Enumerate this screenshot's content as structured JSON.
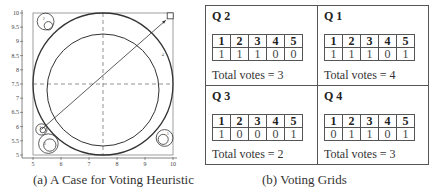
{
  "figure_a": {
    "caption": "(a) A Case for Voting Heuristic",
    "x_ticks": [
      "5",
      "6",
      "7",
      "8",
      "9",
      "10"
    ],
    "y_ticks": [
      "5",
      "5.5",
      "6",
      "6.5",
      "7",
      "7.5",
      "8",
      "8.5",
      "9",
      "9.5",
      "10"
    ],
    "xlim": [
      5,
      10
    ],
    "ylim": [
      5,
      10
    ],
    "big_circle": {
      "cx": 7.5,
      "cy": 7.5,
      "r": 2.5
    },
    "inner_circle": {
      "cx": 7.5,
      "cy": 7.5,
      "r": 2.0
    },
    "crosshair": {
      "x": 7.5,
      "y": 7.5
    },
    "arrow": {
      "from": [
        5.3,
        5.9
      ],
      "to": [
        9.85,
        9.85
      ]
    },
    "corner_square": {
      "x": 9.9,
      "y": 9.9
    },
    "center_label": "4",
    "center_label_pos": [
      9.6,
      8.5
    ],
    "small_circles": [
      {
        "name": "top-left",
        "outer": [
          5.45,
          9.7,
          0.3
        ],
        "inner": [
          5.55,
          9.55,
          0.15
        ],
        "label": "2",
        "label_pos": [
          5.35,
          9.75
        ]
      },
      {
        "name": "bottom-left-small",
        "outer": [
          5.3,
          5.9,
          0.2
        ],
        "inner": [
          5.35,
          5.88,
          0.1
        ],
        "label": "1",
        "label_pos": [
          5.22,
          5.9
        ]
      },
      {
        "name": "bottom-left-large",
        "outer": [
          5.55,
          5.4,
          0.35
        ],
        "inner": [
          5.6,
          5.35,
          0.22
        ],
        "label": "3",
        "label_pos": [
          5.38,
          5.35
        ]
      },
      {
        "name": "bottom-right",
        "outer": [
          9.7,
          5.6,
          0.3
        ],
        "inner": [
          9.65,
          5.55,
          0.18
        ],
        "label": "5",
        "label_pos": [
          9.78,
          5.7
        ]
      }
    ]
  },
  "figure_b": {
    "caption": "(b) Voting Grids",
    "panels": [
      {
        "title": "Q 2",
        "headers": [
          "1",
          "2",
          "3",
          "4",
          "5"
        ],
        "values": [
          "1",
          "1",
          "1",
          "0",
          "0"
        ],
        "total": "Total votes = 3"
      },
      {
        "title": "Q 1",
        "headers": [
          "1",
          "2",
          "3",
          "4",
          "5"
        ],
        "values": [
          "1",
          "1",
          "1",
          "0",
          "1"
        ],
        "total": "Total votes = 4"
      },
      {
        "title": "Q 3",
        "headers": [
          "1",
          "2",
          "3",
          "4",
          "5"
        ],
        "values": [
          "1",
          "0",
          "0",
          "0",
          "1"
        ],
        "total": "Total votes = 2"
      },
      {
        "title": "Q 4",
        "headers": [
          "1",
          "2",
          "3",
          "4",
          "5"
        ],
        "values": [
          "0",
          "1",
          "1",
          "0",
          "1"
        ],
        "total": "Total votes = 3"
      }
    ]
  }
}
